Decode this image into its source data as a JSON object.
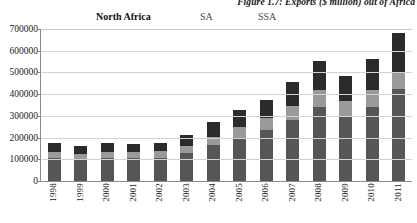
{
  "figure": {
    "title": "Figure 1.7: Exports ($ million) out of Africa"
  },
  "legend": {
    "items": [
      {
        "label": "North Africa",
        "color": "#2b2b2b"
      },
      {
        "label": "SA",
        "color": "#9a9a9a"
      },
      {
        "label": "SSA",
        "color": "#565656"
      }
    ]
  },
  "axis": {
    "y_ticks": [
      "0",
      "100000",
      "200000",
      "300000",
      "400000",
      "500000",
      "600000",
      "700000"
    ]
  },
  "chart_data": {
    "type": "bar",
    "stacked": true,
    "title": "Figure 1.7: Exports ($ million) out of Africa",
    "xlabel": "",
    "ylabel": "",
    "ylim": [
      0,
      700000
    ],
    "ytick_step": 100000,
    "grid": true,
    "legend_position": "top",
    "categories": [
      "1998",
      "1999",
      "2000",
      "2001",
      "2002",
      "2003",
      "2004",
      "2005",
      "2006",
      "2007",
      "2008",
      "2009",
      "2010",
      "2011"
    ],
    "series": [
      {
        "name": "SSA",
        "color": "#565656",
        "values": [
          105000,
          98000,
          108000,
          105000,
          108000,
          130000,
          165000,
          200000,
          235000,
          280000,
          340000,
          300000,
          340000,
          425000
        ]
      },
      {
        "name": "SA",
        "color": "#9a9a9a",
        "values": [
          28000,
          26000,
          27000,
          27000,
          28000,
          33000,
          40000,
          47000,
          55000,
          65000,
          80000,
          68000,
          80000,
          78000
        ]
      },
      {
        "name": "North Africa",
        "color": "#2b2b2b",
        "values": [
          40000,
          38000,
          42000,
          40000,
          40000,
          50000,
          65000,
          78000,
          85000,
          112000,
          135000,
          115000,
          140000,
          177000
        ]
      }
    ],
    "totals": [
      173000,
      162000,
      177000,
      172000,
      176000,
      213000,
      270000,
      325000,
      375000,
      457000,
      555000,
      483000,
      560000,
      680000
    ]
  }
}
